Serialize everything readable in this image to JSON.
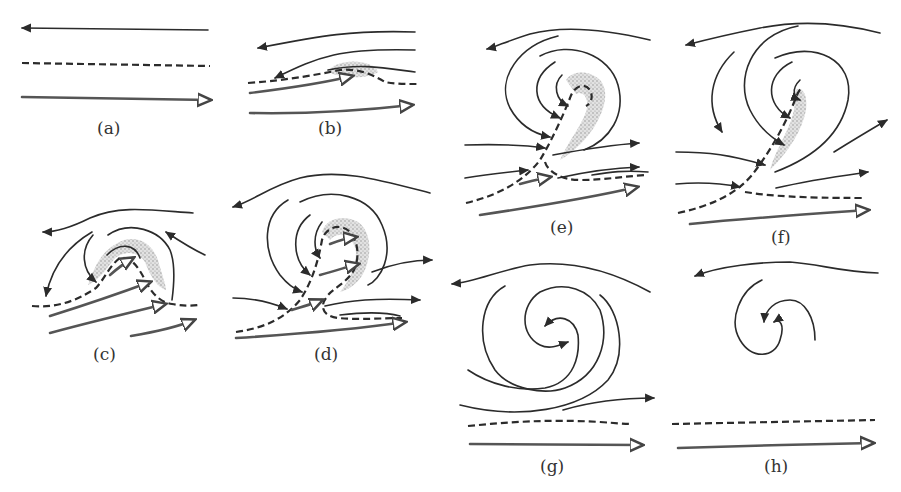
{
  "figure": {
    "colors": {
      "line": "#2b2b2b",
      "warm_arrow": "#555555",
      "stipple": "#9a9a9a",
      "background": "#ffffff"
    },
    "legend_elements": {
      "solid_arrow": "streamline",
      "dashed_line": "frontal boundary",
      "double_line_arrow": "warm air flow",
      "stippled_area": "cloud region"
    },
    "panels": [
      {
        "id": "a",
        "label": "(a)",
        "stage": "undisturbed flow with straight frontal line"
      },
      {
        "id": "b",
        "label": "(b)",
        "stage": "initial wave on front"
      },
      {
        "id": "c",
        "label": "(c)",
        "stage": "developing wave with cloud band"
      },
      {
        "id": "d",
        "label": "(d)",
        "stage": "cyclonic circulation forms"
      },
      {
        "id": "e",
        "label": "(e)",
        "stage": "mature cyclone, occlusion begins"
      },
      {
        "id": "f",
        "label": "(f)",
        "stage": "occluded cyclone"
      },
      {
        "id": "g",
        "label": "(g)",
        "stage": "cut-off vortex, front restored below"
      },
      {
        "id": "h",
        "label": "(h)",
        "stage": "decaying vortex"
      }
    ]
  }
}
